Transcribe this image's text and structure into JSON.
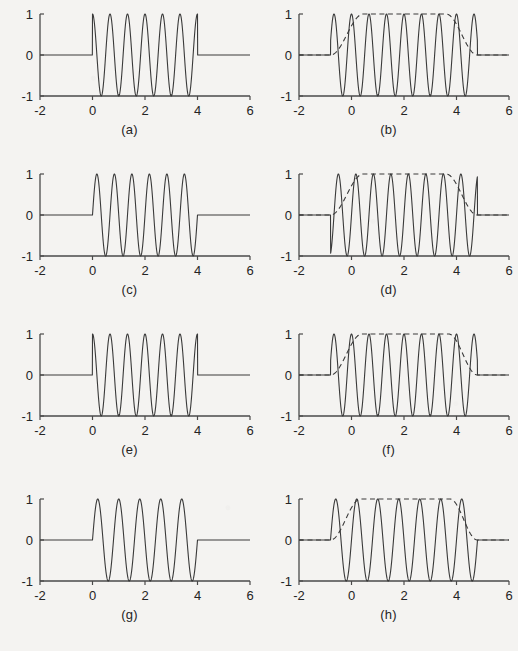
{
  "figure": {
    "background_color": "#f4f3f1",
    "line_color": "#3a3a3a",
    "axis_color": "#4a4a4a",
    "panel_count": 8,
    "columns": 2,
    "rows": 4
  },
  "panels": [
    {
      "label": "(a)",
      "position": "row1-left"
    },
    {
      "label": "(b)",
      "position": "row1-right"
    },
    {
      "label": "(c)",
      "position": "row2-left"
    },
    {
      "label": "(d)",
      "position": "row2-right"
    },
    {
      "label": "(e)",
      "position": "row3-left"
    },
    {
      "label": "(f)",
      "position": "row3-right"
    },
    {
      "label": "(g)",
      "position": "row4-left"
    },
    {
      "label": "(h)",
      "position": "row4-right"
    }
  ],
  "chart_data": [
    {
      "type": "line",
      "title": "(a)",
      "xlabel": "",
      "ylabel": "",
      "xlim": [
        -2,
        6
      ],
      "ylim": [
        -1,
        1
      ],
      "xticks": [
        -2,
        0,
        2,
        4,
        6
      ],
      "xticklabels": [
        "-2",
        "0",
        "2",
        "4",
        "6"
      ],
      "yticks": [
        -1,
        0,
        1
      ],
      "yticklabels": [
        "-1",
        "0",
        "1"
      ],
      "grid": false,
      "legend": null,
      "series": [
        {
          "name": "rectangular-windowed sinusoid",
          "style": "solid",
          "window": "rectangular",
          "support": [
            0,
            4
          ],
          "amplitude": 1,
          "cycles": 6,
          "frequency_hz": 1.5,
          "phase": "sine-start-positive",
          "phase_deg": 90,
          "zero_outside_support": true
        }
      ]
    },
    {
      "type": "line",
      "title": "(b)",
      "xlabel": "",
      "ylabel": "",
      "xlim": [
        -2,
        6
      ],
      "ylim": [
        -1,
        1
      ],
      "xticks": [
        -2,
        0,
        2,
        4,
        6
      ],
      "xticklabels": [
        "-2",
        "0",
        "2",
        "4",
        "6"
      ],
      "yticks": [
        -1,
        0,
        1
      ],
      "yticklabels": [
        "-1",
        "0",
        "1"
      ],
      "grid": false,
      "legend": null,
      "series": [
        {
          "name": "smoothly windowed sinusoid",
          "style": "solid",
          "window": "smooth-taper",
          "support": [
            -0.8,
            4.8
          ],
          "amplitude": 1,
          "cycles": 6,
          "frequency_hz": 1.5,
          "phase": "sine-start-positive",
          "phase_deg": 90,
          "zero_outside_support": true
        },
        {
          "name": "envelope",
          "style": "dashed",
          "window": "smooth-taper",
          "support": [
            -0.8,
            4.8
          ],
          "flat_top": [
            0.45,
            3.6
          ],
          "amplitude": 1
        }
      ]
    },
    {
      "type": "line",
      "title": "(c)",
      "xlabel": "",
      "ylabel": "",
      "xlim": [
        -2,
        6
      ],
      "ylim": [
        -1,
        1
      ],
      "xticks": [
        -2,
        0,
        2,
        4,
        6
      ],
      "xticklabels": [
        "-2",
        "0",
        "2",
        "4",
        "6"
      ],
      "yticks": [
        -1,
        0,
        1
      ],
      "yticklabels": [
        "-1",
        "0",
        "1"
      ],
      "grid": false,
      "legend": null,
      "series": [
        {
          "name": "rectangular-windowed sinusoid",
          "style": "solid",
          "window": "rectangular",
          "support": [
            0,
            4
          ],
          "amplitude": 1,
          "cycles": 6,
          "frequency_hz": 1.5,
          "phase": "sine-rising-from-zero",
          "phase_deg": 0,
          "zero_outside_support": true
        }
      ]
    },
    {
      "type": "line",
      "title": "(d)",
      "xlabel": "",
      "ylabel": "",
      "xlim": [
        -2,
        6
      ],
      "ylim": [
        -1,
        1
      ],
      "xticks": [
        -2,
        0,
        2,
        4,
        6
      ],
      "xticklabels": [
        "-2",
        "0",
        "2",
        "4",
        "6"
      ],
      "yticks": [
        -1,
        0,
        1
      ],
      "yticklabels": [
        "-1",
        "0",
        "1"
      ],
      "grid": false,
      "legend": null,
      "series": [
        {
          "name": "smoothly windowed sinusoid",
          "style": "solid",
          "window": "smooth-taper",
          "support": [
            -0.8,
            4.8
          ],
          "amplitude": 1,
          "cycles": 6,
          "frequency_hz": 1.5,
          "phase": "sine-rising-from-zero",
          "phase_deg": 0,
          "zero_outside_support": true
        },
        {
          "name": "envelope",
          "style": "dashed",
          "window": "smooth-taper",
          "support": [
            -0.8,
            4.8
          ],
          "flat_top": [
            0.45,
            3.6
          ],
          "amplitude": 1
        }
      ]
    },
    {
      "type": "line",
      "title": "(e)",
      "xlabel": "",
      "ylabel": "",
      "xlim": [
        -2,
        6
      ],
      "ylim": [
        -1,
        1
      ],
      "xticks": [
        -2,
        0,
        2,
        4,
        6
      ],
      "xticklabels": [
        "-2",
        "0",
        "2",
        "4",
        "6"
      ],
      "yticks": [
        -1,
        0,
        1
      ],
      "yticklabels": [
        "-1",
        "0",
        "1"
      ],
      "grid": false,
      "legend": null,
      "series": [
        {
          "name": "rectangular-windowed sinusoid",
          "style": "solid",
          "window": "rectangular",
          "support": [
            0,
            4
          ],
          "amplitude": 1,
          "cycles": 6,
          "frequency_hz": 1.5,
          "phase": "cosine-start-at-peak",
          "phase_deg": 90,
          "zero_outside_support": true
        }
      ]
    },
    {
      "type": "line",
      "title": "(f)",
      "xlabel": "",
      "ylabel": "",
      "xlim": [
        -2,
        6
      ],
      "ylim": [
        -1,
        1
      ],
      "xticks": [
        -2,
        0,
        2,
        4,
        6
      ],
      "xticklabels": [
        "-2",
        "0",
        "2",
        "4",
        "6"
      ],
      "yticks": [
        -1,
        0,
        1
      ],
      "yticklabels": [
        "-1",
        "0",
        "1"
      ],
      "grid": false,
      "legend": null,
      "series": [
        {
          "name": "smoothly windowed sinusoid",
          "style": "solid",
          "window": "smooth-taper",
          "support": [
            -0.8,
            4.8
          ],
          "amplitude": 1,
          "cycles": 6,
          "frequency_hz": 1.5,
          "phase": "cosine-start-at-peak",
          "phase_deg": 90,
          "zero_outside_support": true
        },
        {
          "name": "envelope",
          "style": "dashed",
          "window": "smooth-taper",
          "support": [
            -0.8,
            4.8
          ],
          "flat_top": [
            0.4,
            3.7
          ],
          "amplitude": 1
        }
      ]
    },
    {
      "type": "line",
      "title": "(g)",
      "xlabel": "",
      "ylabel": "",
      "xlim": [
        -2,
        6
      ],
      "ylim": [
        -1,
        1
      ],
      "xticks": [
        -2,
        0,
        2,
        4,
        6
      ],
      "xticklabels": [
        "-2",
        "0",
        "2",
        "4",
        "6"
      ],
      "yticks": [
        -1,
        0,
        1
      ],
      "yticklabels": [
        "-1",
        "0",
        "1"
      ],
      "grid": false,
      "legend": null,
      "series": [
        {
          "name": "rectangular-windowed sinusoid",
          "style": "solid",
          "window": "rectangular",
          "support": [
            0,
            4
          ],
          "amplitude": 1,
          "cycles": 5,
          "frequency_hz": 1.25,
          "phase": "sine-rising-from-zero",
          "phase_deg": 0,
          "zero_outside_support": true
        }
      ]
    },
    {
      "type": "line",
      "title": "(h)",
      "xlabel": "",
      "ylabel": "",
      "xlim": [
        -2,
        6
      ],
      "ylim": [
        -1,
        1
      ],
      "xticks": [
        -2,
        0,
        2,
        4,
        6
      ],
      "xticklabels": [
        "-2",
        "0",
        "2",
        "4",
        "6"
      ],
      "yticks": [
        -1,
        0,
        1
      ],
      "yticklabels": [
        "-1",
        "0",
        "1"
      ],
      "grid": false,
      "legend": null,
      "series": [
        {
          "name": "smoothly windowed sinusoid",
          "style": "solid",
          "window": "smooth-taper",
          "support": [
            -0.8,
            4.8
          ],
          "amplitude": 1,
          "cycles": 5,
          "frequency_hz": 1.25,
          "phase": "sine-rising-from-zero",
          "phase_deg": 0,
          "zero_outside_support": true
        },
        {
          "name": "envelope",
          "style": "dashed",
          "window": "smooth-taper",
          "support": [
            -0.8,
            4.8
          ],
          "flat_top": [
            0.35,
            3.75
          ],
          "amplitude": 1
        }
      ]
    }
  ]
}
